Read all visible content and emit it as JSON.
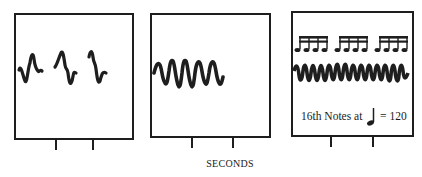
{
  "figure": {
    "x_axis_label": "SECONDS",
    "panels": [
      {
        "id": "panel-1",
        "description": "Three separate waveform bursts",
        "bursts": 3,
        "ticks_x": [
          56,
          93
        ]
      },
      {
        "id": "panel-2",
        "description": "Five closely spaced waveform bursts",
        "bursts": 5,
        "ticks_x": [
          192,
          233
        ]
      },
      {
        "id": "panel-3",
        "description": "Continuous dense waveform under three groups of four 16th notes",
        "note_groups": 3,
        "notes_per_group": 4,
        "caption_prefix": "16th Notes at",
        "caption_tempo_symbol": "quarter-note",
        "caption_equals": "=",
        "caption_tempo_value": "120",
        "ticks_x": [
          331,
          373
        ]
      }
    ]
  },
  "colors": {
    "ink": "#1e1e1e",
    "background": "#ffffff"
  }
}
